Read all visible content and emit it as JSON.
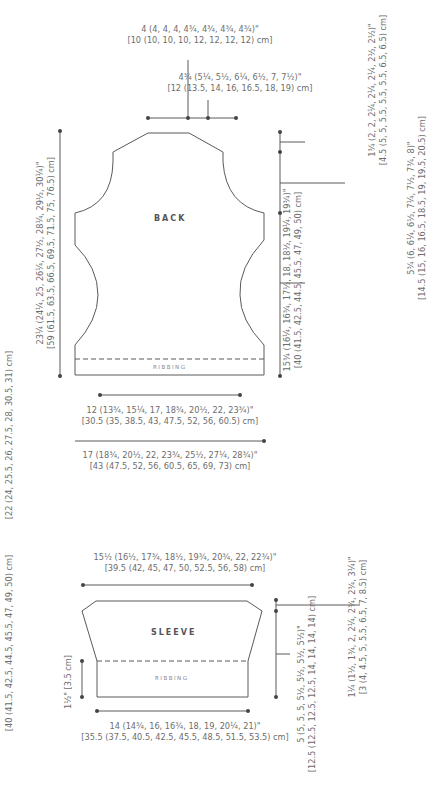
{
  "back": {
    "title": "BACK",
    "ribbing_label": "RIBBING",
    "neck_width": {
      "in": "4 (4, 4, 4, 4¾, 4¾, 4¾, 4¾)\"",
      "cm": "[10 (10, 10, 10, 12, 12, 12, 12) cm]"
    },
    "shoulder_width": {
      "in": "4¾ (5¼, 5½, 6¼, 6½, 7, 7½)\"",
      "cm": "[12 (13.5, 14, 16, 16.5, 18, 19) cm]"
    },
    "shoulder_drop": {
      "in": "1¾ (2, 2, 2¼, 2¼, 2¼, 2½, 2½)\"",
      "cm": "[4.5 (5, 5, 5.5, 5.5, 5.5, 6.5, 6.5) cm]"
    },
    "armhole_depth": {
      "in": "5¾ (6, 6¼, 6½, 7¼, 7½, 7¾, 8)\"",
      "cm": "[14.5 (15, 16, 16.5, 18.5, 19, 19.5, 20.5) cm]"
    },
    "side_length": {
      "in": "15¾ (16¼, 16¾, 17½, 18, 18½, 19¼, 19¾)\"",
      "cm": "[40 (41.5, 42.5, 44.5, 45.5, 47, 49, 50) cm]"
    },
    "total_length": {
      "in": "23¼ (24¼, 25, 26¼, 27½, 28¼, 29½, 30¼)\"",
      "cm": "[59 (61.5, 63.5, 66.5, 69.5, 71.5, 75, 76.5) cm]"
    },
    "waist_width": {
      "in": "12 (13¾, 15¼, 17, 18¾, 20½, 22, 23¾)\"",
      "cm": "[30.5 (35, 38.5, 43, 47.5, 52, 56, 60.5) cm]"
    },
    "hip_width": {
      "in": "17 (18¾, 20½, 22, 23¾, 25½, 27¼, 28¾)\"",
      "cm": "[43 (47.5, 52, 56, 60.5, 65, 69, 73) cm]"
    }
  },
  "left_margin": {
    "upper_cm": "[22 (24, 25.5, 26, 27.5, 28, 30.5, 31) cm]",
    "lower_cm": "[40 (41.5, 42.5, 44.5, 45.5, 47, 49, 50)  cm]"
  },
  "sleeve": {
    "title": "SLEEVE",
    "ribbing_label": "RIBBING",
    "top_width": {
      "in": "15½ (16½, 17¾, 18½, 19¾, 20¾, 22, 22¾)\"",
      "cm": "[39.5 (42, 45, 47, 50, 52.5, 56, 58) cm]"
    },
    "ribbing_height": "1½\" [3.5 cm]",
    "cuff_width": {
      "in": "14 (14¾, 16, 16¾, 18, 19, 20¼, 21)\"",
      "cm": "[35.5 (37.5, 40.5, 42.5, 45.5, 48.5, 51.5, 53.5) cm]"
    },
    "cap_depth": {
      "in": "1¼ (1½, 1¾, 2, 2¼, 2¾, 2¾, 3¼)\"",
      "cm": "[3 (4, 4.5, 5, 5.5, 6.5, 7, 8.5) cm]"
    },
    "length": {
      "in": "5 (5, 5, 5, 5½, 5½, 5½, 5½)\"",
      "cm": "[12.5 (12.5, 12.5, 12.5, 14, 14, 14, 14) cm]"
    }
  },
  "colors": {
    "line": "#555555",
    "text": "#6d6d6d",
    "background": "#ffffff"
  }
}
